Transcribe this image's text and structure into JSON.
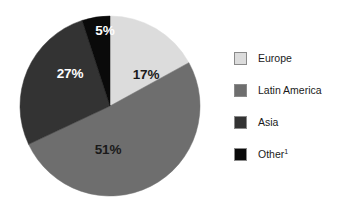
{
  "chart_data": {
    "type": "pie",
    "title": "",
    "categories": [
      "Europe",
      "Latin America",
      "Asia",
      "Other"
    ],
    "values": [
      17,
      51,
      27,
      5
    ],
    "value_labels": [
      "17%",
      "51%",
      "27%",
      "5%"
    ],
    "colors": [
      "#dcdcdc",
      "#6e6e6e",
      "#333333",
      "#0a0a0a"
    ],
    "label_text_colors": [
      "#1a1a1a",
      "#1a1a1a",
      "#ffffff",
      "#ffffff"
    ],
    "units": "percent",
    "start_angle_deg": 0,
    "direction": "clockwise",
    "legend_position": "right",
    "grid": false,
    "footnote_marker": "1"
  },
  "pie": {
    "center_x": 110,
    "center_y": 106,
    "radius": 90,
    "slices": [
      {
        "name": "Europe",
        "percent": 17,
        "label": "17%",
        "label_x": 146,
        "label_y": 75,
        "fill": "#dcdcdc",
        "text_color": "#1a1a1a"
      },
      {
        "name": "Latin America",
        "percent": 51,
        "label": "51%",
        "label_x": 108,
        "label_y": 150,
        "fill": "#6e6e6e",
        "text_color": "#1a1a1a"
      },
      {
        "name": "Asia",
        "percent": 27,
        "label": "27%",
        "label_x": 70,
        "label_y": 74,
        "fill": "#333333",
        "text_color": "#ffffff"
      },
      {
        "name": "Other",
        "percent": 5,
        "label": "5%",
        "label_x": 105,
        "label_y": 31,
        "fill": "#0a0a0a",
        "text_color": "#ffffff"
      }
    ]
  },
  "legend": {
    "items": [
      {
        "label": "Europe",
        "swatch_color": "#dcdcdc",
        "superscript": "",
        "top": 6
      },
      {
        "label": "Latin America",
        "swatch_color": "#6e6e6e",
        "superscript": "",
        "top": 38
      },
      {
        "label": "Asia",
        "swatch_color": "#333333",
        "superscript": "",
        "top": 70
      },
      {
        "label": "Other",
        "swatch_color": "#0a0a0a",
        "superscript": "1",
        "top": 102
      }
    ]
  }
}
